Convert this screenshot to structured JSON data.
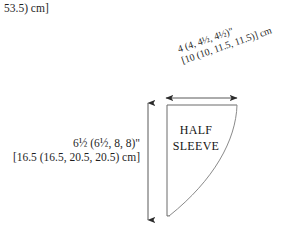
{
  "document": {
    "type": "garment-schematic",
    "piece_name_line1": "HALF",
    "piece_name_line2": "SLEEVE",
    "background_color": "#ffffff",
    "line_color": "#4a4a4a",
    "text_color": "#1f1f1f"
  },
  "top_fragment": {
    "text": "53.5) cm]"
  },
  "diagonal_dimension": {
    "orientation": "rotated",
    "angle_degrees": -19,
    "line1": "4 (4, 4½, 4½)\"",
    "line2": "[10 (10, 11.5, 11.5)] cm",
    "inches_values": [
      "4",
      "4",
      "4½",
      "4½"
    ],
    "cm_values": [
      "10",
      "10",
      "11.5",
      "11.5"
    ]
  },
  "left_dimension": {
    "line1": "6½ (6½, 8, 8)\"",
    "line2": "[16.5 (16.5, 20.5, 20.5) cm]",
    "inches_values": [
      "6½",
      "6½",
      "8",
      "8"
    ],
    "cm_values": [
      "16.5",
      "16.5",
      "20.5",
      "20.5"
    ]
  },
  "arrows": {
    "vertical": {
      "name": "height-dimension-arrow",
      "from_y": 103,
      "to_y": 220,
      "x": 148
    },
    "horizontal": {
      "name": "width-dimension-arrow",
      "from_x": 166,
      "to_x": 237,
      "y": 98
    }
  },
  "shape": {
    "name": "half-sleeve-outline",
    "top_edge_y": 105,
    "left_edge_x": 167,
    "right_top_x": 237,
    "bottom_point": {
      "x": 170,
      "y": 216
    }
  }
}
